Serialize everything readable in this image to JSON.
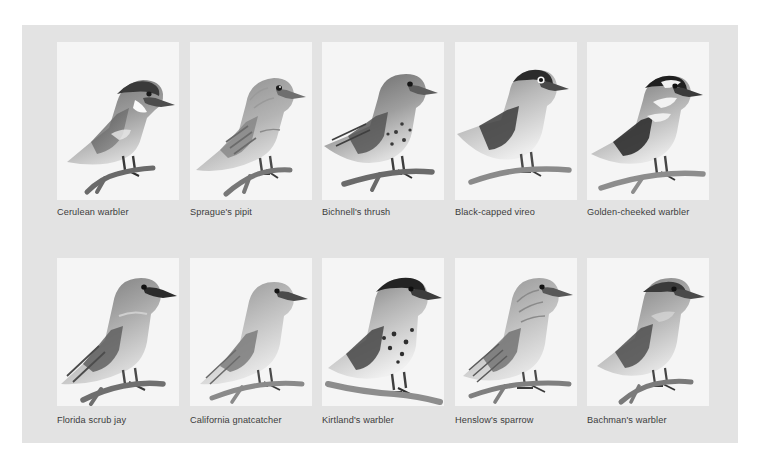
{
  "figure": {
    "type": "illustration-plate",
    "background_color": "#e3e3e3",
    "panel_color": "#f5f5f5",
    "caption_color": "#3c3c3c",
    "columns": 5,
    "rows": 2
  },
  "rows": [
    {
      "items": [
        {
          "caption": "Cerulean warbler",
          "icon": "bird-illustration",
          "pose": "perched-left-facing-right"
        },
        {
          "caption": "Sprague's pipit",
          "icon": "bird-illustration",
          "pose": "perched-facing-right"
        },
        {
          "caption": "Bichnell's thrush",
          "icon": "bird-illustration",
          "pose": "perched-facing-right"
        },
        {
          "caption": "Black-capped vireo",
          "icon": "bird-illustration",
          "pose": "perched-facing-right"
        },
        {
          "caption": "Golden-cheeked warbler",
          "icon": "bird-illustration",
          "pose": "perched-facing-right"
        }
      ]
    },
    {
      "items": [
        {
          "caption": "Florida scrub jay",
          "icon": "bird-illustration",
          "pose": "perched-facing-right"
        },
        {
          "caption": "California gnatcatcher",
          "icon": "bird-illustration",
          "pose": "perched-facing-right"
        },
        {
          "caption": "Kirtland's warbler",
          "icon": "bird-illustration",
          "pose": "perched-facing-right"
        },
        {
          "caption": "Henslow's sparrow",
          "icon": "bird-illustration",
          "pose": "perched-facing-right"
        },
        {
          "caption": "Bachman's warbler",
          "icon": "bird-illustration",
          "pose": "perched-facing-right"
        }
      ]
    }
  ],
  "layout": {
    "cell_x_offsets": [
      35,
      168,
      300,
      433,
      565
    ],
    "panel_width": 122,
    "row1_panel_height": 158,
    "row2_panel_height": 148
  }
}
